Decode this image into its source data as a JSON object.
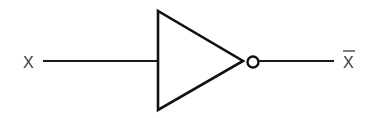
{
  "diagram": {
    "type": "logic-gate",
    "gate": "NOT (inverter)",
    "input": {
      "label": "X"
    },
    "output": {
      "label": "X",
      "overline": true
    },
    "colors": {
      "stroke": "#111111",
      "text": "#3a3a3a",
      "background": "#ffffff"
    }
  }
}
